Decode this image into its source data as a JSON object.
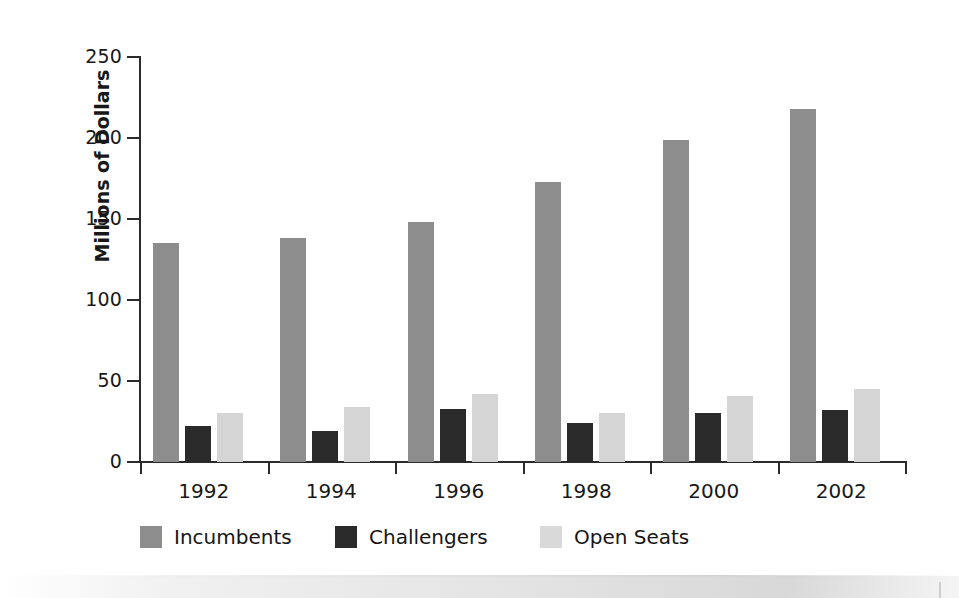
{
  "chart_data": {
    "type": "bar",
    "title": "",
    "subtitle": "",
    "xlabel": "",
    "ylabel": "Millions of Dollars",
    "categories": [
      "1992",
      "1994",
      "1996",
      "1998",
      "2000",
      "2002"
    ],
    "series": [
      {
        "name": "Incumbents",
        "color": "#8d8d8d",
        "values": [
          135,
          138,
          148,
          173,
          199,
          218
        ]
      },
      {
        "name": "Challengers",
        "color": "#2a2a2a",
        "values": [
          22,
          19,
          33,
          24,
          30,
          32
        ]
      },
      {
        "name": "Open Seats",
        "color": "#d5d5d5",
        "values": [
          30,
          34,
          42,
          30,
          41,
          45
        ]
      }
    ],
    "ylim": [
      0,
      250
    ],
    "yticks": [
      0,
      50,
      100,
      150,
      200,
      250
    ],
    "ytick_labels": [
      "0",
      "50",
      "100",
      "150",
      "200",
      "250"
    ],
    "grid": false,
    "legend_position": "bottom",
    "legend_entries": [
      "Incumbents",
      "Challengers",
      "Open Seats"
    ]
  },
  "axes": {
    "y_axis_title": "Millions of Dollars",
    "y_tick_labels": [
      "250",
      "200",
      "150",
      "100",
      "50",
      "0"
    ],
    "x_tick_labels": [
      "1992",
      "1994",
      "1996",
      "1998",
      "2000",
      "2002"
    ]
  },
  "legend": {
    "items": [
      {
        "label": "Incumbents",
        "swatch": "medium-gray-swatch"
      },
      {
        "label": "Challengers",
        "swatch": "dark-gray-swatch"
      },
      {
        "label": "Open Seats",
        "swatch": "light-gray-swatch"
      }
    ]
  },
  "colors": {
    "incumbents": "#8d8d8d",
    "challengers": "#2a2a2a",
    "open_seats": "#d5d5d5",
    "axis": "#2b2b2b",
    "text": "#181818",
    "background": "#ffffff"
  }
}
